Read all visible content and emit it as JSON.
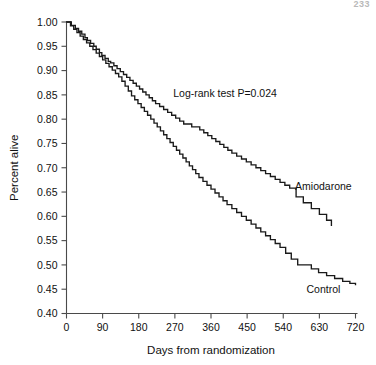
{
  "page": {
    "page_number": "233"
  },
  "chart_data": {
    "type": "line",
    "subtype": "kaplan-meier-step",
    "title": "",
    "xlabel": "Days from randomization",
    "ylabel": "Percent alive",
    "xlim": [
      0,
      720
    ],
    "ylim": [
      0.4,
      1.0
    ],
    "xticks": [
      0,
      90,
      180,
      270,
      360,
      450,
      540,
      630,
      720
    ],
    "xticklabels": [
      "0",
      "90",
      "180",
      "270",
      "360",
      "450",
      "540",
      "630",
      "720"
    ],
    "yticks": [
      0.4,
      0.45,
      0.5,
      0.55,
      0.6,
      0.65,
      0.7,
      0.75,
      0.8,
      0.85,
      0.9,
      0.95,
      1.0
    ],
    "yticklabels": [
      "0.40",
      "0.45",
      "0.50",
      "0.55",
      "0.60",
      "0.65",
      "0.70",
      "0.75",
      "0.80",
      "0.85",
      "0.90",
      "0.95",
      "1.00"
    ],
    "grid": false,
    "legend_position": "inline-curve-labels",
    "annotations": [
      {
        "name": "logrank-annotation",
        "text": "Log-rank test P=0.024",
        "x": 395,
        "y": 0.845
      }
    ],
    "series": [
      {
        "name": "Amiodarone",
        "color": "#1a1a1a",
        "label_x": 640,
        "label_y": 0.655,
        "x": [
          0,
          12,
          22,
          30,
          38,
          46,
          52,
          60,
          68,
          74,
          82,
          88,
          96,
          104,
          110,
          118,
          126,
          134,
          142,
          150,
          158,
          166,
          174,
          182,
          190,
          198,
          206,
          214,
          222,
          232,
          242,
          252,
          262,
          272,
          282,
          292,
          302,
          312,
          322,
          332,
          342,
          352,
          362,
          372,
          382,
          392,
          402,
          412,
          424,
          436,
          448,
          460,
          472,
          484,
          496,
          508,
          520,
          532,
          544,
          556,
          572,
          590,
          610,
          630,
          648,
          660
        ],
        "y": [
          1.0,
          0.993,
          0.987,
          0.981,
          0.975,
          0.968,
          0.962,
          0.956,
          0.95,
          0.944,
          0.937,
          0.931,
          0.925,
          0.919,
          0.916,
          0.91,
          0.904,
          0.898,
          0.892,
          0.886,
          0.88,
          0.874,
          0.868,
          0.862,
          0.856,
          0.85,
          0.844,
          0.838,
          0.832,
          0.826,
          0.82,
          0.814,
          0.808,
          0.802,
          0.796,
          0.79,
          0.79,
          0.784,
          0.784,
          0.778,
          0.772,
          0.766,
          0.76,
          0.754,
          0.748,
          0.742,
          0.736,
          0.73,
          0.724,
          0.718,
          0.712,
          0.706,
          0.7,
          0.694,
          0.688,
          0.682,
          0.676,
          0.67,
          0.664,
          0.658,
          0.64,
          0.628,
          0.616,
          0.604,
          0.592,
          0.58
        ]
      },
      {
        "name": "Control",
        "color": "#1a1a1a",
        "label_x": 640,
        "label_y": 0.442,
        "x": [
          0,
          10,
          18,
          26,
          34,
          42,
          50,
          58,
          66,
          74,
          82,
          90,
          98,
          106,
          114,
          122,
          130,
          138,
          146,
          154,
          162,
          170,
          178,
          186,
          194,
          202,
          210,
          218,
          226,
          234,
          242,
          250,
          258,
          266,
          274,
          282,
          290,
          298,
          306,
          314,
          322,
          330,
          340,
          350,
          360,
          370,
          380,
          390,
          400,
          412,
          424,
          436,
          448,
          460,
          472,
          484,
          496,
          508,
          520,
          532,
          546,
          560,
          576,
          592,
          610,
          628,
          648,
          668,
          688,
          706,
          720
        ],
        "y": [
          1.0,
          0.992,
          0.985,
          0.978,
          0.971,
          0.964,
          0.957,
          0.95,
          0.943,
          0.936,
          0.929,
          0.922,
          0.915,
          0.908,
          0.901,
          0.894,
          0.887,
          0.878,
          0.868,
          0.858,
          0.848,
          0.84,
          0.832,
          0.824,
          0.816,
          0.808,
          0.8,
          0.792,
          0.784,
          0.776,
          0.768,
          0.76,
          0.752,
          0.744,
          0.736,
          0.728,
          0.72,
          0.712,
          0.704,
          0.696,
          0.688,
          0.68,
          0.672,
          0.664,
          0.656,
          0.648,
          0.64,
          0.632,
          0.624,
          0.616,
          0.608,
          0.6,
          0.592,
          0.584,
          0.576,
          0.568,
          0.56,
          0.552,
          0.544,
          0.536,
          0.524,
          0.512,
          0.5,
          0.5,
          0.492,
          0.484,
          0.478,
          0.472,
          0.466,
          0.462,
          0.458
        ]
      }
    ]
  }
}
